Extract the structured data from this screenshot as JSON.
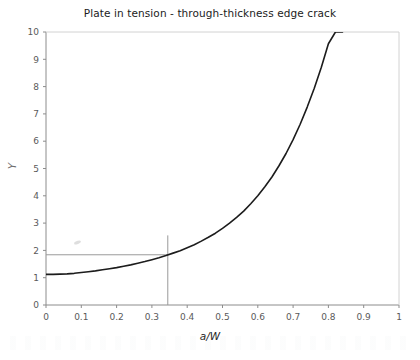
{
  "chart_data": {
    "type": "line",
    "title": "Plate in tension - through-thickness edge crack",
    "xlabel": "a/W",
    "ylabel": "Y",
    "xlim": [
      0,
      1
    ],
    "ylim": [
      0,
      10
    ],
    "grid": false,
    "legend": "none",
    "x_ticks": [
      "0",
      "0.1",
      "0.2",
      "0.3",
      "0.4",
      "0.5",
      "0.6",
      "0.7",
      "0.8",
      "0.9",
      "1"
    ],
    "y_ticks": [
      "0",
      "1",
      "2",
      "3",
      "4",
      "5",
      "6",
      "7",
      "8",
      "9",
      "10"
    ],
    "series": [
      {
        "name": "Y geometry factor",
        "color": "#1c1c1c",
        "x": [
          0.0,
          0.02,
          0.04,
          0.06,
          0.08,
          0.1,
          0.12,
          0.14,
          0.16,
          0.18,
          0.2,
          0.22,
          0.24,
          0.26,
          0.28,
          0.3,
          0.32,
          0.34,
          0.36,
          0.38,
          0.4,
          0.42,
          0.44,
          0.46,
          0.48,
          0.5,
          0.52,
          0.54,
          0.56,
          0.58,
          0.6,
          0.62,
          0.64,
          0.66,
          0.68,
          0.7,
          0.72,
          0.74,
          0.76,
          0.78,
          0.8,
          0.82,
          0.84
        ],
        "values": [
          1.12,
          1.12,
          1.13,
          1.14,
          1.16,
          1.19,
          1.22,
          1.25,
          1.29,
          1.33,
          1.37,
          1.42,
          1.47,
          1.53,
          1.59,
          1.66,
          1.73,
          1.81,
          1.9,
          1.99,
          2.1,
          2.21,
          2.34,
          2.48,
          2.63,
          2.81,
          3.0,
          3.21,
          3.44,
          3.71,
          4.0,
          4.33,
          4.69,
          5.1,
          5.55,
          6.06,
          6.62,
          7.25,
          7.94,
          8.71,
          9.57,
          10.0,
          10.0
        ]
      }
    ],
    "annotations": [
      {
        "name": "horizontal-construction-line",
        "orientation": "horizontal",
        "y_value": 1.84,
        "x_from": 0.0,
        "x_to": 0.345,
        "color": "#9a9a9a"
      },
      {
        "name": "vertical-construction-line",
        "orientation": "vertical",
        "x_value": 0.345,
        "y_from": 0.0,
        "y_to": 2.55,
        "color": "#9a9a9a"
      }
    ]
  },
  "figure": {
    "title": "Plate in tension - through-thickness edge crack",
    "xlabel": "a/W",
    "ylabel": "Y"
  },
  "axis": {
    "x_ticks": [
      "0",
      "0.1",
      "0.2",
      "0.3",
      "0.4",
      "0.5",
      "0.6",
      "0.7",
      "0.8",
      "0.9",
      "1"
    ],
    "y_ticks": [
      "10",
      "9",
      "8",
      "7",
      "6",
      "5",
      "4",
      "3",
      "2",
      "1",
      "0"
    ]
  },
  "colors": {
    "curve": "#1c1c1c",
    "axis": "#8c8c8c",
    "construction": "#9a9a9a",
    "text": "#1b1b1b",
    "tick_text": "#5a5a5a",
    "background": "#ffffff"
  }
}
